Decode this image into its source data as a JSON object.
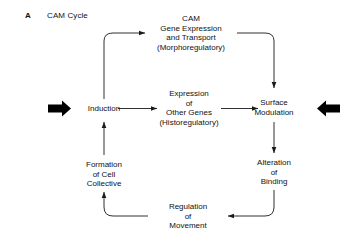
{
  "figure": {
    "panel_letter": "A",
    "panel_title": "CAM Cycle",
    "background_color": "#ffffff",
    "line_color": "#1a1a1a",
    "text_color": "#111111"
  },
  "nodes": {
    "top": {
      "name": "cam-gene-expression-and-transport",
      "lines": [
        "CAM",
        "Gene Expression",
        "and Transport",
        "(Morphoregulatory)"
      ]
    },
    "center": {
      "name": "expression-of-other-genes",
      "lines": [
        "Expression",
        "of",
        "Other Genes",
        "(Historegulatory)"
      ]
    },
    "left": {
      "name": "induction",
      "lines": [
        "Induction"
      ]
    },
    "right": {
      "name": "surface-modulation",
      "lines": [
        "Surface",
        "Modulation"
      ]
    },
    "right_lower": {
      "name": "alteration-of-binding",
      "lines": [
        "Alteration",
        "of",
        "Binding"
      ]
    },
    "bottom": {
      "name": "regulation-of-movement",
      "lines": [
        "Regulation",
        "of",
        "Movement"
      ]
    },
    "left_lower": {
      "name": "formation-of-cell-collective",
      "lines": [
        "Formation",
        "of Cell",
        "Collective"
      ]
    }
  },
  "connectors": [
    {
      "name": "induction-to-cam-gene-expression",
      "from": "induction",
      "to": "cam-gene-expression-and-transport"
    },
    {
      "name": "induction-to-expression-of-other-genes",
      "from": "induction",
      "to": "expression-of-other-genes"
    },
    {
      "name": "cam-gene-expression-to-surface-modulation",
      "from": "cam-gene-expression-and-transport",
      "to": "surface-modulation"
    },
    {
      "name": "expression-of-other-genes-to-surface-modulation",
      "from": "expression-of-other-genes",
      "to": "surface-modulation"
    },
    {
      "name": "surface-modulation-to-alteration-of-binding",
      "from": "surface-modulation",
      "to": "alteration-of-binding"
    },
    {
      "name": "alteration-of-binding-to-regulation-of-movement",
      "from": "alteration-of-binding",
      "to": "regulation-of-movement"
    },
    {
      "name": "regulation-of-movement-to-formation-of-cell-collective",
      "from": "regulation-of-movement",
      "to": "formation-of-cell-collective"
    },
    {
      "name": "formation-of-cell-collective-to-induction",
      "from": "formation-of-cell-collective",
      "to": "induction"
    }
  ],
  "block_arrows": [
    {
      "name": "input-arrow-left",
      "direction": "right",
      "target": "induction"
    },
    {
      "name": "input-arrow-right",
      "direction": "left",
      "target": "surface-modulation"
    }
  ]
}
